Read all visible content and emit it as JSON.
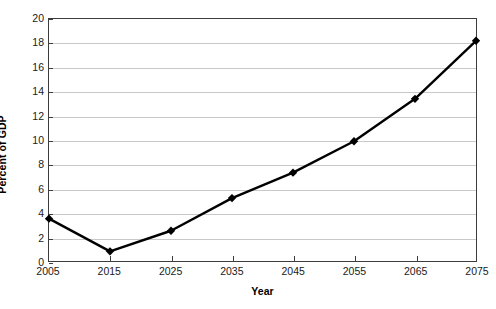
{
  "chart_data": {
    "type": "line",
    "title": "",
    "subtitle": "",
    "xlabel": "Year",
    "ylabel": "Percent of GDP",
    "x": [
      2005,
      2015,
      2025,
      2035,
      2045,
      2055,
      2065,
      2075
    ],
    "categories": [
      "2005",
      "2015",
      "2025",
      "2035",
      "2045",
      "2055",
      "2065",
      "2075"
    ],
    "values": [
      3.5,
      0.8,
      2.5,
      5.2,
      7.3,
      9.9,
      13.4,
      18.2
    ],
    "series": [
      {
        "name": "",
        "values": [
          3.5,
          0.8,
          2.5,
          5.2,
          7.3,
          9.9,
          13.4,
          18.2
        ],
        "color": "#000000",
        "marker": "diamond",
        "line_width": 2.4
      }
    ],
    "xlim": [
      2005,
      2075
    ],
    "ylim": [
      0,
      20
    ],
    "x_ticks": [
      2005,
      2015,
      2025,
      2035,
      2045,
      2055,
      2065,
      2075
    ],
    "y_ticks": [
      0,
      2,
      4,
      6,
      8,
      10,
      12,
      14,
      16,
      18,
      20
    ],
    "x_tick_labels": [
      "2005",
      "2015",
      "2025",
      "2035",
      "2045",
      "2055",
      "2065",
      "2075"
    ],
    "y_tick_labels": [
      "0",
      "2",
      "4",
      "6",
      "8",
      "10",
      "12",
      "14",
      "16",
      "18",
      "20"
    ],
    "grid": "horizontal",
    "grid_color": "#c9c9c9",
    "legend": "none",
    "frame_color": "#3d3d3d",
    "background": "#ffffff"
  }
}
